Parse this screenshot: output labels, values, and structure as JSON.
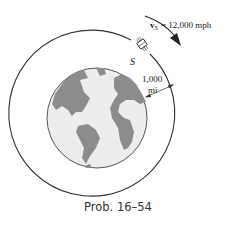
{
  "figure": {
    "velocity_symbol": "v",
    "velocity_subscript": "S",
    "velocity_value": "= 12,000 mph",
    "satellite_label": "S",
    "altitude_value": "1,000",
    "altitude_unit": "mi",
    "caption": "Prob. 16–54"
  },
  "colors": {
    "earth_ocean": "#ededed",
    "earth_land": "#8c8c8c",
    "lines": "#333333"
  }
}
